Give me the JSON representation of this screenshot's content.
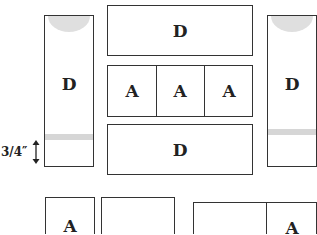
{
  "labels": {
    "left_tall": "D",
    "top_wide": "D",
    "row_a": [
      "A",
      "A",
      "A"
    ],
    "bottom_wide": "D",
    "right_tall": "D",
    "bottom_left": "A",
    "bottom_right": "A"
  },
  "dimension": {
    "text": "3/4″"
  },
  "colors": {
    "stroke": "#333333",
    "shade": "#d9d9d9"
  }
}
